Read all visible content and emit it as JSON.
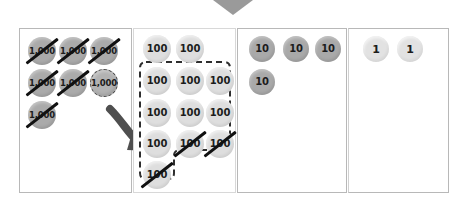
{
  "diagram": {
    "caret_color": "#9a9a9a",
    "panels": [
      {
        "name": "thousands",
        "place_label": "1,000",
        "disc_color": "#aaaaaa",
        "total_discs": 6,
        "crossed_out": 5,
        "highlighted_dashed": 1,
        "discs": [
          {
            "label": "1,000",
            "crossed": true,
            "dashed": false,
            "x": 8,
            "y": 8
          },
          {
            "label": "1,000",
            "crossed": true,
            "dashed": false,
            "x": 39,
            "y": 8
          },
          {
            "label": "1,000",
            "crossed": true,
            "dashed": false,
            "x": 70,
            "y": 8
          },
          {
            "label": "1,000",
            "crossed": true,
            "dashed": false,
            "x": 8,
            "y": 40
          },
          {
            "label": "1,000",
            "crossed": true,
            "dashed": false,
            "x": 39,
            "y": 40
          },
          {
            "label": "1,000",
            "crossed": false,
            "dashed": true,
            "x": 70,
            "y": 40
          },
          {
            "label": "1,000",
            "crossed": true,
            "dashed": false,
            "x": 8,
            "y": 72
          }
        ]
      },
      {
        "name": "hundreds",
        "place_label": "100",
        "disc_color": "#dedede",
        "total_discs": 12,
        "crossed_out": 3,
        "regroup_outline": "dashed",
        "discs": [
          {
            "label": "100",
            "crossed": false,
            "x": 9,
            "y": 6
          },
          {
            "label": "100",
            "crossed": false,
            "x": 42,
            "y": 6
          },
          {
            "label": "100",
            "crossed": false,
            "x": 9,
            "y": 38
          },
          {
            "label": "100",
            "crossed": false,
            "x": 42,
            "y": 38
          },
          {
            "label": "100",
            "crossed": false,
            "x": 72,
            "y": 38
          },
          {
            "label": "100",
            "crossed": false,
            "x": 9,
            "y": 70
          },
          {
            "label": "100",
            "crossed": false,
            "x": 42,
            "y": 70
          },
          {
            "label": "100",
            "crossed": false,
            "x": 72,
            "y": 70
          },
          {
            "label": "100",
            "crossed": false,
            "x": 9,
            "y": 101
          },
          {
            "label": "100",
            "crossed": true,
            "x": 42,
            "y": 101
          },
          {
            "label": "100",
            "crossed": true,
            "x": 72,
            "y": 101
          },
          {
            "label": "100",
            "crossed": true,
            "x": 9,
            "y": 132
          }
        ]
      },
      {
        "name": "tens",
        "place_label": "10",
        "disc_color": "#a9a9a9",
        "total_discs": 4,
        "crossed_out": 0,
        "discs": [
          {
            "label": "10",
            "crossed": false,
            "x": 11,
            "y": 7
          },
          {
            "label": "10",
            "crossed": false,
            "x": 45,
            "y": 7
          },
          {
            "label": "10",
            "crossed": false,
            "x": 77,
            "y": 7
          },
          {
            "label": "10",
            "crossed": false,
            "x": 11,
            "y": 40
          }
        ]
      },
      {
        "name": "ones",
        "place_label": "1",
        "disc_color": "#e2e2e2",
        "total_discs": 2,
        "crossed_out": 0,
        "discs": [
          {
            "label": "1",
            "crossed": false,
            "x": 14,
            "y": 7
          },
          {
            "label": "1",
            "crossed": false,
            "x": 48,
            "y": 7
          }
        ]
      }
    ],
    "arrow": {
      "name": "regroup-arrow",
      "color": "#4f4f4f",
      "from": "thousands-disc-6",
      "to": "hundreds-panel"
    }
  }
}
